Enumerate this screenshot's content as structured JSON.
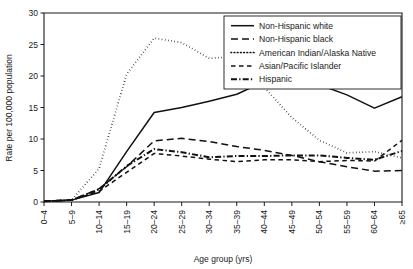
{
  "chart_data": {
    "type": "line",
    "title": "",
    "subtitle": "",
    "xlabel": "Age group (yrs)",
    "ylabel": "Rate per 100,000 population",
    "ylim": [
      0,
      30
    ],
    "yticks": [
      0,
      5,
      10,
      15,
      20,
      25,
      30
    ],
    "ytick_labels": [
      "0",
      "5",
      "10",
      "15",
      "20",
      "25",
      "30"
    ],
    "grid": false,
    "legend_position": "top-right",
    "categories": [
      "0–4",
      "5–9",
      "10–14",
      "15–19",
      "20–24",
      "25–29",
      "30–34",
      "35–39",
      "40–44",
      "45–49",
      "50–54",
      "55–59",
      "60–64",
      "≥65"
    ],
    "series": [
      {
        "name": "Non-Hispanic white",
        "style": "solid",
        "color": "#111111",
        "values": [
          0.1,
          0.3,
          1.5,
          8.0,
          14.2,
          15.0,
          16.0,
          17.1,
          19.1,
          19.9,
          18.6,
          17.0,
          14.9,
          16.7
        ]
      },
      {
        "name": "Non-Hispanic black",
        "style": "dashed",
        "color": "#111111",
        "values": [
          0.1,
          0.3,
          2.1,
          5.6,
          9.7,
          10.1,
          9.6,
          8.8,
          8.2,
          7.4,
          6.4,
          5.6,
          4.9,
          5.0
        ]
      },
      {
        "name": "American Indian/Alaska Native",
        "style": "dotted",
        "color": "#111111",
        "values": [
          0.1,
          0.3,
          5.3,
          20.3,
          26.0,
          25.3,
          22.8,
          23.1,
          18.2,
          13.4,
          9.8,
          7.8,
          8.0,
          7.0
        ]
      },
      {
        "name": "Asian/Pacific Islander",
        "style": "longdash",
        "color": "#111111",
        "values": [
          0.1,
          0.3,
          1.7,
          4.7,
          7.7,
          7.3,
          6.8,
          6.4,
          6.7,
          6.7,
          6.4,
          6.6,
          6.5,
          9.8
        ]
      },
      {
        "name": "Hispanic",
        "style": "dashdot",
        "color": "#111111",
        "values": [
          0.1,
          0.3,
          2.0,
          5.7,
          8.4,
          7.9,
          7.1,
          7.3,
          7.3,
          7.4,
          7.4,
          7.0,
          6.7,
          8.1
        ]
      }
    ]
  },
  "axes": {
    "y_title": "Rate per 100,000 population",
    "x_title": "Age group (yrs)"
  },
  "legend": {
    "items": [
      {
        "label": "Non-Hispanic white",
        "style": "solid"
      },
      {
        "label": "Non-Hispanic black",
        "style": "dashed"
      },
      {
        "label": "American Indian/Alaska Native",
        "style": "dotted"
      },
      {
        "label": "Asian/Pacific Islander",
        "style": "longdash"
      },
      {
        "label": "Hispanic",
        "style": "dashdot"
      }
    ]
  }
}
